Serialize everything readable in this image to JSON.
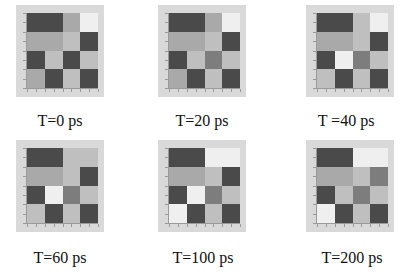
{
  "figure": {
    "grid_size": 4,
    "shades": {
      "D": "#4a4a4a",
      "G": "#7d7d7d",
      "M": "#a9a9a9",
      "L": "#bfbfbf",
      "W": "#efefef"
    },
    "panels": [
      {
        "label": "T=0 ps",
        "cells": [
          [
            "D",
            "D",
            "M",
            "W"
          ],
          [
            "M",
            "M",
            "L",
            "D"
          ],
          [
            "D",
            "L",
            "D",
            "L"
          ],
          [
            "M",
            "D",
            "L",
            "D"
          ]
        ]
      },
      {
        "label": "T=20 ps",
        "cells": [
          [
            "D",
            "D",
            "M",
            "W"
          ],
          [
            "M",
            "M",
            "L",
            "D"
          ],
          [
            "D",
            "L",
            "G",
            "L"
          ],
          [
            "M",
            "D",
            "L",
            "D"
          ]
        ]
      },
      {
        "label": "T =40 ps",
        "cells": [
          [
            "D",
            "D",
            "L",
            "W"
          ],
          [
            "M",
            "M",
            "L",
            "D"
          ],
          [
            "D",
            "W",
            "G",
            "L"
          ],
          [
            "L",
            "D",
            "L",
            "D"
          ]
        ]
      },
      {
        "label": "T=60 ps",
        "cells": [
          [
            "D",
            "D",
            "L",
            "L"
          ],
          [
            "M",
            "M",
            "L",
            "D"
          ],
          [
            "D",
            "W",
            "G",
            "L"
          ],
          [
            "L",
            "D",
            "L",
            "D"
          ]
        ]
      },
      {
        "label": "T=100 ps",
        "cells": [
          [
            "D",
            "D",
            "W",
            "W"
          ],
          [
            "M",
            "M",
            "L",
            "D"
          ],
          [
            "D",
            "W",
            "G",
            "L"
          ],
          [
            "W",
            "D",
            "L",
            "D"
          ]
        ]
      },
      {
        "label": "T=200 ps",
        "cells": [
          [
            "D",
            "D",
            "W",
            "W"
          ],
          [
            "M",
            "M",
            "L",
            "G"
          ],
          [
            "D",
            "L",
            "G",
            "L"
          ],
          [
            "W",
            "D",
            "L",
            "D"
          ]
        ]
      }
    ]
  }
}
